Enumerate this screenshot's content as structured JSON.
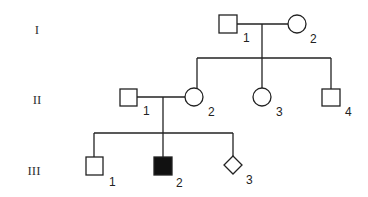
{
  "diagram": {
    "type": "pedigree",
    "generations": [
      {
        "label": "I",
        "members": [
          {
            "id": "I-1",
            "number": "1",
            "sex": "male",
            "affected": false
          },
          {
            "id": "I-2",
            "number": "2",
            "sex": "female",
            "affected": false
          }
        ]
      },
      {
        "label": "II",
        "members": [
          {
            "id": "II-1",
            "number": "1",
            "sex": "male",
            "affected": false
          },
          {
            "id": "II-2",
            "number": "2",
            "sex": "female",
            "affected": false
          },
          {
            "id": "II-3",
            "number": "3",
            "sex": "female",
            "affected": false
          },
          {
            "id": "II-4",
            "number": "4",
            "sex": "male",
            "affected": false
          }
        ]
      },
      {
        "label": "III",
        "members": [
          {
            "id": "III-1",
            "number": "1",
            "sex": "male",
            "affected": false
          },
          {
            "id": "III-2",
            "number": "2",
            "sex": "male",
            "affected": true
          },
          {
            "id": "III-3",
            "number": "3",
            "sex": "unknown",
            "affected": false
          }
        ]
      }
    ],
    "relationships": [
      {
        "type": "mating",
        "partners": [
          "I-1",
          "I-2"
        ],
        "children": [
          "II-2",
          "II-3",
          "II-4"
        ]
      },
      {
        "type": "mating",
        "partners": [
          "II-1",
          "II-2"
        ],
        "children": [
          "III-1",
          "III-2",
          "III-3"
        ]
      }
    ]
  }
}
